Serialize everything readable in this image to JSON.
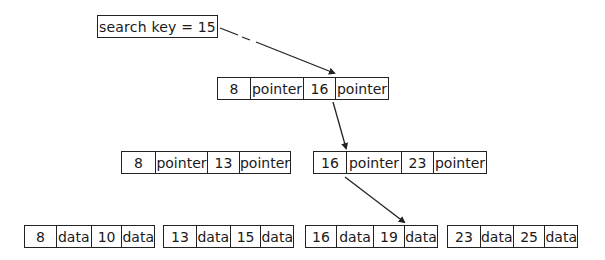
{
  "search": {
    "label": "search key = 15"
  },
  "root": {
    "cells": [
      "8",
      "pointer",
      "16",
      "pointer"
    ]
  },
  "internal": [
    {
      "cells": [
        "8",
        "pointer",
        "13",
        "pointer"
      ]
    },
    {
      "cells": [
        "16",
        "pointer",
        "23",
        "pointer"
      ]
    }
  ],
  "leaves": [
    {
      "cells": [
        "8",
        "data",
        "10",
        "data"
      ]
    },
    {
      "cells": [
        "13",
        "data",
        "15",
        "data"
      ]
    },
    {
      "cells": [
        "16",
        "data",
        "19",
        "data"
      ]
    },
    {
      "cells": [
        "23",
        "data",
        "25",
        "data"
      ]
    }
  ],
  "colors": {
    "stroke": "#222222",
    "background": "#ffffff"
  }
}
